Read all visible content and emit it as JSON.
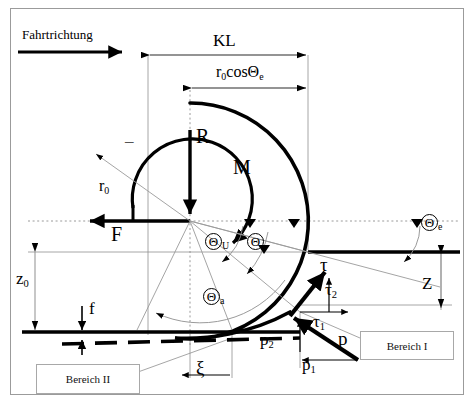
{
  "figure": {
    "type": "engineering-diagram",
    "background": "#ffffff",
    "line_color": "#000000",
    "thin_line_color": "#8c8c8c",
    "frame": {
      "border_color": "#9b9b9b"
    }
  },
  "labels": {
    "travel_direction": "Fahrtrichtung",
    "contact_length": "KL",
    "radius_projection_main": "r",
    "radius_projection_sub": "0",
    "radius_projection_rest": "cosΘ",
    "radius_projection_rest_sub": "e",
    "vertical_load": "R",
    "moment": "M",
    "horizontal_force": "F",
    "radius_main": "r",
    "radius_sub": "0",
    "minus_sign": "–",
    "theta_u_main": "Θ",
    "theta_u_sub": "U",
    "theta_main": "Θ",
    "theta_a_main": "Θ",
    "theta_a_sub": "a",
    "theta_e_main": "Θ",
    "theta_e_sub": "e",
    "shear_tau": "τ",
    "shear_tau2_main": "τ",
    "shear_tau2_sub": "2",
    "shear_tau1_main": "τ",
    "shear_tau1_sub": "1",
    "pressure_p": "p",
    "pressure_p1_main": "p",
    "pressure_p1_sub": "1",
    "pressure_p2_main": "p",
    "pressure_p2_sub": "2",
    "sinkage_z0_main": "z",
    "sinkage_z0_sub": "0",
    "sinkage_z": "Z",
    "deflection_f": "f",
    "slip_xi": "ξ",
    "region_one": "Bereich I",
    "region_two": "Bereich II"
  }
}
